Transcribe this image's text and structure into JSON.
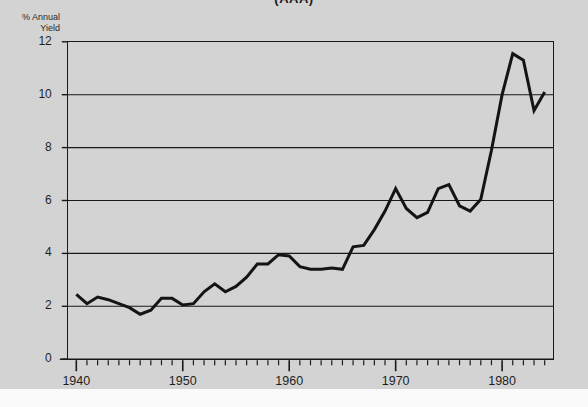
{
  "chart_data": {
    "type": "line",
    "title": "(AAA)",
    "xlabel": "",
    "ylabel": "% Annual Yield",
    "ylabel_lines": [
      "% Annual",
      "Yield"
    ],
    "xlim": [
      1939.2,
      1984.8
    ],
    "ylim": [
      0,
      12
    ],
    "grid": true,
    "grid_axis": "y",
    "gridlines": [
      2,
      4,
      6,
      8,
      10
    ],
    "legend": null,
    "legend_position": "none",
    "yticks": [
      0,
      2,
      4,
      6,
      8,
      10,
      12
    ],
    "ytick_labels": [
      "0",
      "2",
      "4",
      "6",
      "8",
      "10",
      "12"
    ],
    "xticks": [
      1940,
      1950,
      1960,
      1970,
      1980
    ],
    "xtick_labels": [
      "1940",
      "1950",
      "1960",
      "1970",
      "1980"
    ],
    "x_minor_tick_interval": 1,
    "x_minor_ticks_from": 1940,
    "x_minor_ticks_to": 1984,
    "line_color": "#141414",
    "line_width": 3.0,
    "background_color": "#d3d3d3",
    "axis_color": "#181818",
    "x": [
      1940,
      1941,
      1942,
      1943,
      1944,
      1945,
      1946,
      1947,
      1948,
      1949,
      1950,
      1951,
      1952,
      1953,
      1954,
      1955,
      1956,
      1957,
      1958,
      1959,
      1960,
      1961,
      1962,
      1963,
      1964,
      1965,
      1966,
      1967,
      1968,
      1969,
      1970,
      1971,
      1972,
      1973,
      1974,
      1975,
      1976,
      1977,
      1978,
      1979,
      1980,
      1981,
      1982,
      1983,
      1984
    ],
    "values": [
      2.45,
      2.1,
      2.35,
      2.25,
      2.1,
      1.95,
      1.7,
      1.85,
      2.3,
      2.3,
      2.05,
      2.1,
      2.55,
      2.85,
      2.55,
      2.75,
      3.1,
      3.6,
      3.6,
      3.95,
      3.9,
      3.5,
      3.4,
      3.4,
      3.45,
      3.4,
      4.25,
      4.3,
      4.9,
      5.6,
      6.45,
      5.7,
      5.35,
      5.55,
      6.45,
      6.6,
      5.8,
      5.6,
      6.05,
      7.9,
      10.0,
      11.55,
      11.3,
      9.4,
      10.1
    ],
    "annotations": [],
    "series_name": "AAA corporate bond yield"
  },
  "axis_caption": {
    "line1": "% Annual",
    "line2": "Yield"
  }
}
